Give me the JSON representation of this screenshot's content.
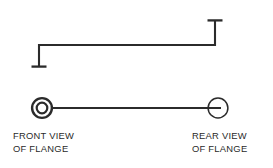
{
  "figure": {
    "background_color": "#ffffff",
    "line_color": "#2b2b2b"
  },
  "labels": {
    "front_view": {
      "line1": "FRONT VIEW",
      "line2": "OF FLANGE"
    },
    "rear_view": {
      "line1": "REAR VIEW",
      "line2": "OF FLANGE"
    }
  },
  "upper_diagram": {
    "name": "offset-datum-line",
    "left_tick_label": "",
    "right_tick_label": "",
    "horizontal_run_y": 45,
    "left_x": 39,
    "right_x": 215,
    "left_drop_y": 67,
    "right_rise_y": 20,
    "tick_half_width": 7,
    "stroke_width": 2.1
  },
  "lower_diagram": {
    "name": "flange-axis-line",
    "axis_y": 108,
    "front_circle": {
      "cx": 42,
      "cy": 108,
      "outer_r": 10,
      "inner_r": 5.3,
      "outer_stroke": 2.4,
      "inner_stroke": 2.2
    },
    "rear_circle": {
      "cx": 218,
      "cy": 108,
      "r": 10,
      "stroke": 1.5
    },
    "connector_from_x": 52,
    "connector_to_x": 222,
    "connector_stroke": 2.1
  }
}
